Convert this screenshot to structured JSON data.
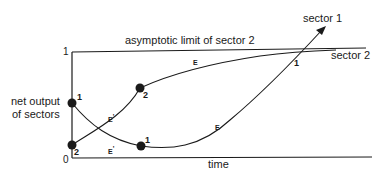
{
  "diagram": {
    "y_axis_label_line1": "net output",
    "y_axis_label_line2": "of sectors",
    "x_axis_label": "time",
    "y_tick_top": "1",
    "origin_label": "0",
    "asymptote_label": "asymptotic limit of sector 2",
    "series": [
      {
        "name": "sector 1",
        "label": "sector 1",
        "start_marker": "1",
        "min_marker": "1",
        "crossing_marker": "1"
      },
      {
        "name": "sector 2",
        "label": "sector 2",
        "start_marker": "2",
        "mid_marker": "2"
      }
    ],
    "segment_labels": {
      "e_prime_upper": "E",
      "e_prime_lower": "E",
      "prime": "'",
      "e_sector2": "E",
      "e_sector1": "E"
    }
  }
}
